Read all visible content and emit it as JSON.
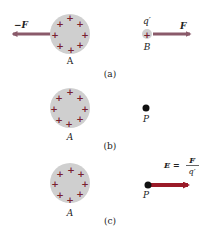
{
  "figure": {
    "panels": [
      {
        "id": "a",
        "caption": "(a)",
        "sphere_label": "A",
        "force_on_A_label": "−F",
        "test_charge_label": "q′",
        "test_charge_point_label": "B",
        "force_on_B_label": "F"
      },
      {
        "id": "b",
        "caption": "(b)",
        "sphere_label": "A",
        "point_label": "P"
      },
      {
        "id": "c",
        "caption": "(c)",
        "sphere_label": "A",
        "point_label": "P",
        "field_eq_lhs": "E =",
        "field_eq_num": "F",
        "field_eq_den": "q′"
      }
    ],
    "charge_symbol": "+",
    "colors": {
      "sphere_fill": "#cfcfcf",
      "charge": "#7a2030",
      "force_arrow": "#8a5a6a",
      "field_arrow": "#9a1a28",
      "point": "#111111"
    }
  }
}
